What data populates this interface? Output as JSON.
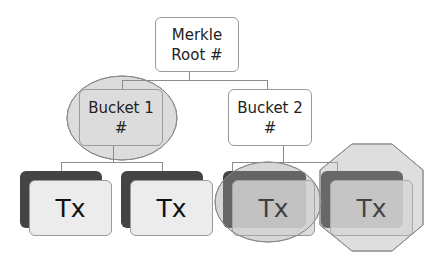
{
  "diagram": {
    "root": {
      "line1": "Merkle",
      "line2": "Root #"
    },
    "buckets": [
      {
        "line1": "Bucket 1",
        "line2": "#",
        "highlight": "ellipse"
      },
      {
        "line1": "Bucket 2",
        "line2": "#",
        "highlight": "none"
      }
    ],
    "transactions": [
      {
        "label": "Tx",
        "highlight": "none"
      },
      {
        "label": "Tx",
        "highlight": "none"
      },
      {
        "label": "Tx",
        "highlight": "ellipse"
      },
      {
        "label": "Tx",
        "highlight": "octagon"
      }
    ],
    "colors": {
      "highlight_fill": "#d8d8d8",
      "highlight_stroke": "#8a8a8a",
      "tx_back": "#444444",
      "tx_front": "#e6e6e6"
    }
  }
}
